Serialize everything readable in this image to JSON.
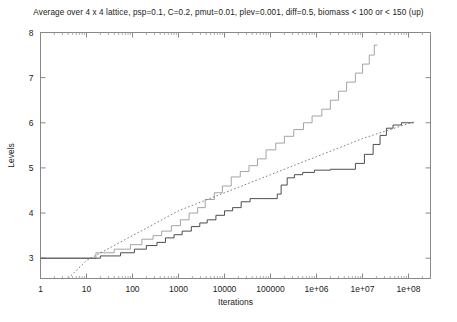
{
  "chart_data": {
    "type": "line",
    "title": "Average over 4 x 4 lattice, psp=0.1, C=0.2, pmut=0.01, plev=0.001, diff=0.5, biomass < 100 or < 150 (up)",
    "xlabel": "Iterations",
    "ylabel": "Levels",
    "xscale": "log",
    "yscale": "linear",
    "xlim": [
      1,
      300000000
    ],
    "ylim": [
      2.55,
      8
    ],
    "grid": false,
    "legend": "none",
    "xticks": [
      1,
      10,
      100,
      1000,
      10000,
      100000,
      1000000,
      10000000,
      100000000
    ],
    "xticklabels": [
      "1",
      "10",
      "100",
      "1000",
      "10000",
      "100000",
      "1e+06",
      "1e+07",
      "1e+08"
    ],
    "yticks": [
      3,
      4,
      5,
      6,
      7,
      8
    ],
    "yticklabels": [
      "3",
      "4",
      "5",
      "6",
      "7",
      "8"
    ],
    "series": [
      {
        "name": "biomass < 150 (up)",
        "style": "step-solid-light",
        "color": "#9a9a9a",
        "points": [
          [
            1,
            3.0
          ],
          [
            16,
            3.0
          ],
          [
            16,
            3.12
          ],
          [
            40,
            3.12
          ],
          [
            40,
            3.2
          ],
          [
            90,
            3.2
          ],
          [
            90,
            3.3
          ],
          [
            160,
            3.3
          ],
          [
            160,
            3.42
          ],
          [
            280,
            3.42
          ],
          [
            280,
            3.5
          ],
          [
            430,
            3.5
          ],
          [
            430,
            3.6
          ],
          [
            700,
            3.6
          ],
          [
            700,
            3.72
          ],
          [
            1100,
            3.72
          ],
          [
            1100,
            3.85
          ],
          [
            1700,
            3.85
          ],
          [
            1700,
            4.0
          ],
          [
            2600,
            4.0
          ],
          [
            2600,
            4.12
          ],
          [
            3800,
            4.12
          ],
          [
            3800,
            4.3
          ],
          [
            6000,
            4.3
          ],
          [
            6000,
            4.45
          ],
          [
            9000,
            4.45
          ],
          [
            9000,
            4.6
          ],
          [
            14000,
            4.6
          ],
          [
            14000,
            4.8
          ],
          [
            22000,
            4.8
          ],
          [
            22000,
            4.92
          ],
          [
            34000,
            4.92
          ],
          [
            34000,
            5.05
          ],
          [
            52000,
            5.05
          ],
          [
            52000,
            5.2
          ],
          [
            80000,
            5.2
          ],
          [
            80000,
            5.4
          ],
          [
            130000,
            5.4
          ],
          [
            130000,
            5.55
          ],
          [
            200000,
            5.55
          ],
          [
            200000,
            5.7
          ],
          [
            320000,
            5.7
          ],
          [
            320000,
            5.85
          ],
          [
            520000,
            5.85
          ],
          [
            520000,
            6.0
          ],
          [
            800000,
            6.0
          ],
          [
            800000,
            6.15
          ],
          [
            1300000,
            6.15
          ],
          [
            1300000,
            6.3
          ],
          [
            2000000,
            6.3
          ],
          [
            2000000,
            6.5
          ],
          [
            3000000,
            6.5
          ],
          [
            3000000,
            6.7
          ],
          [
            4500000,
            6.7
          ],
          [
            4500000,
            6.9
          ],
          [
            7000000,
            6.9
          ],
          [
            7000000,
            7.1
          ],
          [
            10000000,
            7.1
          ],
          [
            10000000,
            7.3
          ],
          [
            14000000,
            7.3
          ],
          [
            14000000,
            7.5
          ],
          [
            18000000,
            7.5
          ],
          [
            18000000,
            7.72
          ],
          [
            21000000,
            7.72
          ]
        ]
      },
      {
        "name": "biomass < 100",
        "style": "step-solid-dark",
        "color": "#3a3a3a",
        "points": [
          [
            1,
            3.0
          ],
          [
            20,
            3.0
          ],
          [
            20,
            3.05
          ],
          [
            55,
            3.05
          ],
          [
            55,
            3.12
          ],
          [
            110,
            3.12
          ],
          [
            110,
            3.2
          ],
          [
            200,
            3.2
          ],
          [
            200,
            3.28
          ],
          [
            340,
            3.28
          ],
          [
            340,
            3.35
          ],
          [
            520,
            3.35
          ],
          [
            520,
            3.45
          ],
          [
            800,
            3.45
          ],
          [
            800,
            3.52
          ],
          [
            1200,
            3.52
          ],
          [
            1200,
            3.6
          ],
          [
            1900,
            3.6
          ],
          [
            1900,
            3.7
          ],
          [
            2900,
            3.7
          ],
          [
            2900,
            3.78
          ],
          [
            4200,
            3.78
          ],
          [
            4200,
            3.85
          ],
          [
            6500,
            3.85
          ],
          [
            6500,
            3.95
          ],
          [
            10000,
            3.95
          ],
          [
            10000,
            4.05
          ],
          [
            15000,
            4.05
          ],
          [
            15000,
            4.12
          ],
          [
            23000,
            4.12
          ],
          [
            23000,
            4.25
          ],
          [
            36000,
            4.25
          ],
          [
            36000,
            4.32
          ],
          [
            56000,
            4.32
          ],
          [
            56000,
            4.32
          ],
          [
            140000,
            4.32
          ],
          [
            140000,
            4.42
          ],
          [
            170000,
            4.42
          ],
          [
            170000,
            4.62
          ],
          [
            230000,
            4.62
          ],
          [
            230000,
            4.78
          ],
          [
            330000,
            4.78
          ],
          [
            330000,
            4.85
          ],
          [
            500000,
            4.85
          ],
          [
            500000,
            4.9
          ],
          [
            900000,
            4.9
          ],
          [
            900000,
            4.95
          ],
          [
            2000000,
            4.95
          ],
          [
            2000000,
            4.97
          ],
          [
            7000000,
            4.97
          ],
          [
            7000000,
            5.1
          ],
          [
            11000000,
            5.1
          ],
          [
            11000000,
            5.3
          ],
          [
            17000000,
            5.3
          ],
          [
            17000000,
            5.52
          ],
          [
            24000000,
            5.52
          ],
          [
            24000000,
            5.72
          ],
          [
            33000000,
            5.72
          ],
          [
            33000000,
            5.88
          ],
          [
            46000000,
            5.88
          ],
          [
            46000000,
            5.95
          ],
          [
            70000000,
            5.95
          ],
          [
            70000000,
            6.0
          ],
          [
            130000000,
            6.0
          ]
        ]
      },
      {
        "name": "fit line",
        "style": "dotted",
        "color": "#707070",
        "points": [
          [
            4,
            2.55
          ],
          [
            10,
            2.95
          ],
          [
            100,
            3.5
          ],
          [
            1000,
            4.05
          ],
          [
            10000,
            4.45
          ],
          [
            100000,
            4.85
          ],
          [
            1000000,
            5.25
          ],
          [
            10000000,
            5.65
          ],
          [
            130000000,
            6.02
          ]
        ]
      }
    ]
  }
}
